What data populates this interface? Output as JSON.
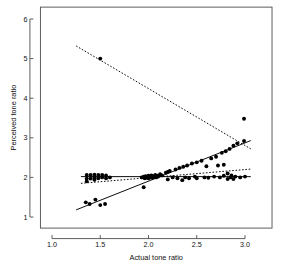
{
  "chart_data": {
    "type": "scatter",
    "title": "",
    "xlabel": "Actual tone ratio",
    "ylabel": "Perceived tone ratio",
    "xlim": [
      0.88,
      3.28
    ],
    "ylim": [
      0.72,
      6.3
    ],
    "xticks": [
      1.0,
      1.5,
      2.0,
      2.5,
      3.0
    ],
    "xticklabels": [
      "1.0",
      "1.5",
      "2.0",
      "2.5",
      "3.0"
    ],
    "yticks": [
      1,
      2,
      3,
      4,
      5,
      6
    ],
    "yticklabels": [
      "1",
      "2",
      "3",
      "4",
      "5",
      "6"
    ],
    "grid": false,
    "legend": "none",
    "marker": "filled-circle",
    "point_color": "#000000",
    "points": [
      [
        1.36,
        2.06
      ],
      [
        1.36,
        1.97
      ],
      [
        1.36,
        1.9
      ],
      [
        1.4,
        2.06
      ],
      [
        1.4,
        1.97
      ],
      [
        1.44,
        2.07
      ],
      [
        1.44,
        2.0
      ],
      [
        1.44,
        1.94
      ],
      [
        1.48,
        2.06
      ],
      [
        1.48,
        1.98
      ],
      [
        1.52,
        2.06
      ],
      [
        1.52,
        2.0
      ],
      [
        1.56,
        2.05
      ],
      [
        1.56,
        1.98
      ],
      [
        1.6,
        2.0
      ],
      [
        1.35,
        1.37
      ],
      [
        1.39,
        1.33
      ],
      [
        1.45,
        1.44
      ],
      [
        1.5,
        1.3
      ],
      [
        1.55,
        1.33
      ],
      [
        1.5,
        5.0
      ],
      [
        1.93,
        2.0
      ],
      [
        1.95,
        2.02
      ],
      [
        1.96,
        1.98
      ],
      [
        1.97,
        2.03
      ],
      [
        1.98,
        1.99
      ],
      [
        1.99,
        2.01
      ],
      [
        2.0,
        2.04
      ],
      [
        2.0,
        1.98
      ],
      [
        2.01,
        2.02
      ],
      [
        2.02,
        2.0
      ],
      [
        2.03,
        2.05
      ],
      [
        2.04,
        1.99
      ],
      [
        2.05,
        2.03
      ],
      [
        2.06,
        2.01
      ],
      [
        2.07,
        2.06
      ],
      [
        2.08,
        2.0
      ],
      [
        2.09,
        2.04
      ],
      [
        2.1,
        2.02
      ],
      [
        2.12,
        2.08
      ],
      [
        2.14,
        2.05
      ],
      [
        1.95,
        1.75
      ],
      [
        2.18,
        2.12
      ],
      [
        2.2,
        2.14
      ],
      [
        2.2,
        1.95
      ],
      [
        2.22,
        2.16
      ],
      [
        2.25,
        2.0
      ],
      [
        2.28,
        2.2
      ],
      [
        2.3,
        1.98
      ],
      [
        2.32,
        2.24
      ],
      [
        2.35,
        1.93
      ],
      [
        2.36,
        2.27
      ],
      [
        2.38,
        2.0
      ],
      [
        2.4,
        2.3
      ],
      [
        2.42,
        1.98
      ],
      [
        2.45,
        2.35
      ],
      [
        2.48,
        2.02
      ],
      [
        2.5,
        2.38
      ],
      [
        2.5,
        1.98
      ],
      [
        2.55,
        2.42
      ],
      [
        2.58,
        2.0
      ],
      [
        2.6,
        2.28
      ],
      [
        2.62,
        1.99
      ],
      [
        2.65,
        2.48
      ],
      [
        2.68,
        2.02
      ],
      [
        2.7,
        2.52
      ],
      [
        2.72,
        2.3
      ],
      [
        2.74,
        2.0
      ],
      [
        2.76,
        2.62
      ],
      [
        2.78,
        2.32
      ],
      [
        2.78,
        2.04
      ],
      [
        2.8,
        2.66
      ],
      [
        2.82,
        2.1
      ],
      [
        2.82,
        1.96
      ],
      [
        2.84,
        2.72
      ],
      [
        2.85,
        2.0
      ],
      [
        2.86,
        2.05
      ],
      [
        2.88,
        2.8
      ],
      [
        2.88,
        1.96
      ],
      [
        2.9,
        2.02
      ],
      [
        2.92,
        2.86
      ],
      [
        2.95,
        2.0
      ],
      [
        2.99,
        2.92
      ],
      [
        3.0,
        2.02
      ],
      [
        2.99,
        3.48
      ]
    ],
    "fit_lines": [
      {
        "name": "identity-regression",
        "style": "solid",
        "x": [
          1.25,
          3.06
        ],
        "y": [
          1.18,
          2.93
        ]
      },
      {
        "name": "constant-fit",
        "style": "solid",
        "x": [
          1.3,
          3.06
        ],
        "y": [
          2.02,
          2.02
        ]
      },
      {
        "name": "decreasing-dotted-fit",
        "style": "dotted",
        "x": [
          1.25,
          3.06
        ],
        "y": [
          5.32,
          2.72
        ]
      },
      {
        "name": "shallow-dotted-fit",
        "style": "dotted",
        "x": [
          1.3,
          3.06
        ],
        "y": [
          1.85,
          2.21
        ]
      }
    ]
  }
}
